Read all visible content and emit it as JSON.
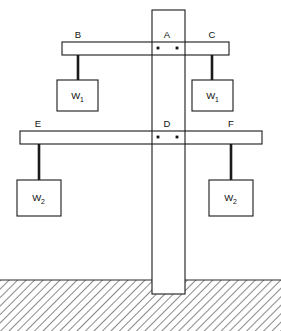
{
  "diagram": {
    "colors": {
      "outline": "#1a1a1a",
      "fill": "#ffffff",
      "ground": "#555555",
      "background": "#ffffff"
    },
    "post": {
      "name": "vertical-post",
      "label": "A",
      "x": 152,
      "y": 10,
      "width": 33,
      "height": 284
    },
    "ground": {
      "label": "",
      "surface_y": 280,
      "hatch_angle_deg": 45
    },
    "beams": [
      {
        "id": "upper-beam",
        "x": 62,
        "y": 42,
        "width": 167,
        "height": 13,
        "center_label": "A",
        "left_label": "B",
        "right_label": "C"
      },
      {
        "id": "lower-beam",
        "x": 20,
        "y": 131,
        "width": 242,
        "height": 13,
        "center_label": "D",
        "left_label": "E",
        "right_label": "F"
      }
    ],
    "labels": [
      {
        "text": "B",
        "x": 78,
        "y": 38
      },
      {
        "text": "A",
        "x": 167,
        "y": 38
      },
      {
        "text": "C",
        "x": 212,
        "y": 38
      },
      {
        "text": "E",
        "x": 38,
        "y": 127
      },
      {
        "text": "D",
        "x": 167,
        "y": 127
      },
      {
        "text": "F",
        "x": 231,
        "y": 127
      }
    ],
    "pivots": [
      {
        "id": "upper-pivot-left",
        "cx": 158,
        "cy": 48
      },
      {
        "id": "upper-pivot-right",
        "cx": 177,
        "cy": 48
      },
      {
        "id": "lower-pivot-left",
        "cx": 158,
        "cy": 137
      },
      {
        "id": "lower-pivot-right",
        "cx": 177,
        "cy": 137
      }
    ],
    "weights": [
      {
        "id": "weight-b",
        "symbol": "W",
        "subscript": "1",
        "box": {
          "x": 57,
          "y": 80,
          "width": 41,
          "height": 31
        },
        "rod": {
          "x": 78,
          "y1": 55,
          "y2": 80
        },
        "attach_label": "B"
      },
      {
        "id": "weight-c",
        "symbol": "W",
        "subscript": "1",
        "box": {
          "x": 192,
          "y": 80,
          "width": 41,
          "height": 31
        },
        "rod": {
          "x": 212,
          "y1": 55,
          "y2": 80
        },
        "attach_label": "C"
      },
      {
        "id": "weight-e",
        "symbol": "W",
        "subscript": "2",
        "box": {
          "x": 17,
          "y": 180,
          "width": 44,
          "height": 36
        },
        "rod": {
          "x": 39,
          "y1": 144,
          "y2": 180
        },
        "attach_label": "E"
      },
      {
        "id": "weight-f",
        "symbol": "W",
        "subscript": "2",
        "box": {
          "x": 209,
          "y": 180,
          "width": 44,
          "height": 36
        },
        "rod": {
          "x": 231,
          "y1": 144,
          "y2": 180
        },
        "attach_label": "F"
      }
    ]
  }
}
